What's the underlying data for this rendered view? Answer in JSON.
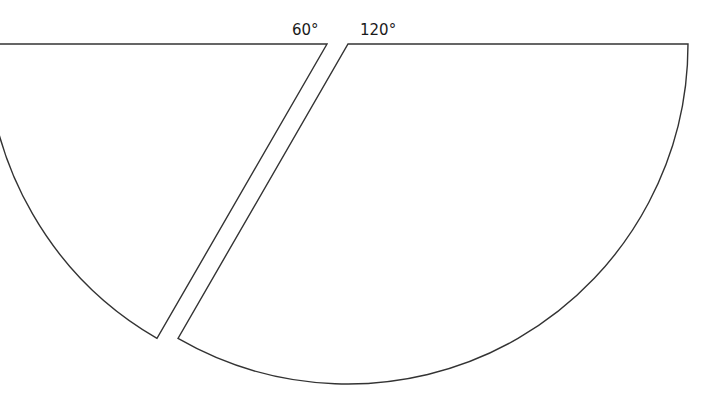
{
  "diagram": {
    "type": "sector-split",
    "stroke_color": "#333333",
    "background": "#ffffff",
    "sectors": [
      {
        "name": "left-sector",
        "angle_label": "60°",
        "apex": [
          327,
          44
        ],
        "radius": 340,
        "start_angle_deg": 180,
        "end_angle_deg": 240
      },
      {
        "name": "right-sector",
        "angle_label": "120°",
        "apex": [
          348,
          44
        ],
        "radius": 340,
        "start_angle_deg": 0,
        "end_angle_deg": 120
      }
    ]
  }
}
